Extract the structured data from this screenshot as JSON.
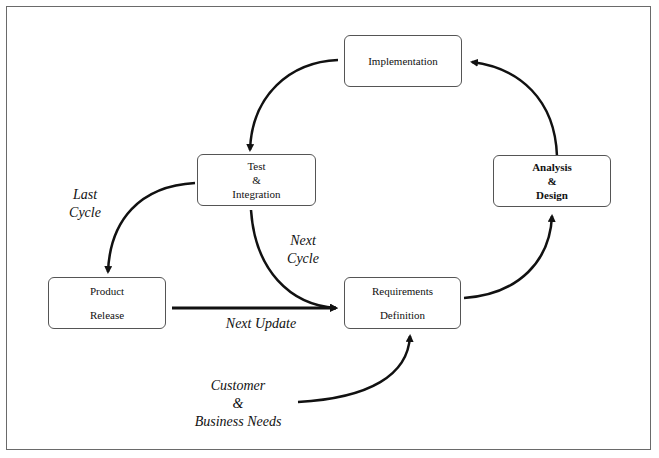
{
  "diagram": {
    "type": "process-cycle",
    "nodes": [
      {
        "id": "implementation",
        "lines": [
          "Implementation"
        ]
      },
      {
        "id": "test-integration",
        "lines": [
          "Test",
          "&",
          "Integration"
        ]
      },
      {
        "id": "analysis-design",
        "lines": [
          "Analysis",
          "&",
          "Design"
        ]
      },
      {
        "id": "product-release",
        "lines": [
          "Product",
          "Release"
        ]
      },
      {
        "id": "requirements-definition",
        "lines": [
          "Requirements",
          "Definition"
        ]
      }
    ],
    "labels": {
      "last_cycle": [
        "Last",
        "Cycle"
      ],
      "next_cycle": [
        "Next",
        "Cycle"
      ],
      "next_update": "Next Update",
      "customer_needs": [
        "Customer",
        "&",
        "Business Needs"
      ]
    },
    "edges": [
      {
        "from": "analysis-design",
        "to": "implementation"
      },
      {
        "from": "implementation",
        "to": "test-integration"
      },
      {
        "from": "test-integration",
        "to": "product-release",
        "label": "Last Cycle"
      },
      {
        "from": "test-integration",
        "to": "requirements-definition",
        "label": "Next Cycle"
      },
      {
        "from": "product-release",
        "to": "requirements-definition",
        "label": "Next Update"
      },
      {
        "from": "customer-business-needs",
        "to": "requirements-definition"
      },
      {
        "from": "requirements-definition",
        "to": "analysis-design"
      }
    ]
  }
}
